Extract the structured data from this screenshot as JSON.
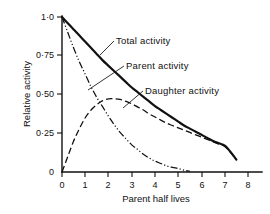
{
  "chart_data": {
    "type": "line",
    "title": "",
    "xlabel": "Parent half lives",
    "ylabel": "Relative activity",
    "xlim": [
      0,
      8.7
    ],
    "ylim": [
      0,
      1.05
    ],
    "grid": false,
    "legend_position": "inline-annotations",
    "xticks": [
      0,
      1,
      2,
      3,
      4,
      5,
      6,
      7,
      8
    ],
    "xtick_labels": [
      "0",
      "1",
      "2",
      "3",
      "4",
      "5",
      "6",
      "7",
      "8"
    ],
    "yticks": [
      0,
      0.25,
      0.5,
      0.75,
      1.0
    ],
    "ytick_labels": [
      "0",
      "0·25",
      "0·50",
      "0·75",
      "1·0"
    ],
    "x": [
      0,
      0.25,
      0.5,
      0.75,
      1,
      1.25,
      1.5,
      1.75,
      2,
      2.25,
      2.5,
      2.75,
      3,
      3.25,
      3.5,
      3.75,
      4,
      4.25,
      4.5,
      4.75,
      5,
      5.25,
      5.5,
      5.75,
      6,
      6.25,
      6.5,
      6.75,
      7,
      7.25,
      7.5
    ],
    "series": [
      {
        "name": "Total activity",
        "style": "solid-thick",
        "label": "Total activity",
        "values": [
          1.0,
          0.96,
          0.92,
          0.88,
          0.84,
          0.8,
          0.76,
          0.72,
          0.685,
          0.65,
          0.615,
          0.58,
          0.545,
          0.515,
          0.485,
          0.455,
          0.425,
          0.4,
          0.375,
          0.35,
          0.325,
          0.3,
          0.28,
          0.26,
          0.24,
          0.22,
          0.2,
          0.185,
          0.17,
          0.13,
          0.08
        ]
      },
      {
        "name": "Parent activity",
        "style": "dash-dot-dot",
        "label": "Parent activity",
        "values": [
          1.0,
          0.9,
          0.8,
          0.71,
          0.63,
          0.55,
          0.48,
          0.42,
          0.36,
          0.305,
          0.255,
          0.215,
          0.175,
          0.145,
          0.115,
          0.09,
          0.07,
          0.055,
          0.04,
          0.03,
          0.022,
          0.012,
          0.004,
          0,
          0,
          0,
          0,
          0,
          0,
          0,
          0
        ]
      },
      {
        "name": "Daughter activity",
        "style": "dashed",
        "label": "Daughter activity",
        "values": [
          0.0,
          0.1,
          0.2,
          0.28,
          0.35,
          0.4,
          0.435,
          0.46,
          0.472,
          0.473,
          0.468,
          0.455,
          0.44,
          0.42,
          0.4,
          0.375,
          0.355,
          0.335,
          0.315,
          0.3,
          0.285,
          0.27,
          0.255,
          0.24,
          0.225,
          0.21,
          0.195,
          0.18,
          0.165,
          0.125,
          0.078
        ]
      }
    ],
    "annotations": [
      {
        "text": "Total activity",
        "x_px": 117,
        "y_px": 44
      },
      {
        "text": "Parent activity",
        "x_px": 127,
        "y_px": 69
      },
      {
        "text": "Daughter activity",
        "x_px": 146,
        "y_px": 94
      }
    ],
    "colors": {
      "ink": "#111111",
      "background": "#ffffff"
    }
  }
}
